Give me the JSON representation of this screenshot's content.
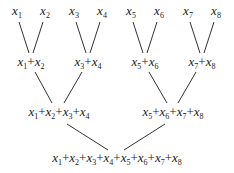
{
  "diagram": {
    "type": "binary reduction tree",
    "leaves": [
      {
        "var": "x",
        "sub": "1",
        "cx": 17,
        "y": 4
      },
      {
        "var": "x",
        "sub": "2",
        "cx": 45,
        "y": 4
      },
      {
        "var": "x",
        "sub": "3",
        "cx": 74,
        "y": 4
      },
      {
        "var": "x",
        "sub": "4",
        "cx": 102,
        "y": 4
      },
      {
        "var": "x",
        "sub": "5",
        "cx": 131,
        "y": 4
      },
      {
        "var": "x",
        "sub": "6",
        "cx": 159,
        "y": 4
      },
      {
        "var": "x",
        "sub": "7",
        "cx": 188,
        "y": 4
      },
      {
        "var": "x",
        "sub": "8",
        "cx": 216,
        "y": 4
      }
    ],
    "level2": [
      {
        "subs": [
          "1",
          "2"
        ],
        "cx": 31,
        "y": 55
      },
      {
        "subs": [
          "3",
          "4"
        ],
        "cx": 88,
        "y": 55
      },
      {
        "subs": [
          "5",
          "6"
        ],
        "cx": 145,
        "y": 55
      },
      {
        "subs": [
          "7",
          "8"
        ],
        "cx": 202,
        "y": 55
      }
    ],
    "level3": [
      {
        "subs": [
          "1",
          "2",
          "3",
          "4"
        ],
        "cx": 59,
        "y": 105
      },
      {
        "subs": [
          "5",
          "6",
          "7",
          "8"
        ],
        "cx": 173,
        "y": 105
      }
    ],
    "root": {
      "subs": [
        "1",
        "2",
        "3",
        "4",
        "5",
        "6",
        "7",
        "8"
      ],
      "cx": 117,
      "y": 151
    },
    "edges": [
      [
        19,
        22,
        29,
        53
      ],
      [
        43,
        22,
        33,
        53
      ],
      [
        76,
        22,
        86,
        53
      ],
      [
        100,
        22,
        90,
        53
      ],
      [
        133,
        22,
        143,
        53
      ],
      [
        157,
        22,
        147,
        53
      ],
      [
        190,
        22,
        200,
        53
      ],
      [
        214,
        22,
        204,
        53
      ],
      [
        35,
        72,
        52,
        103
      ],
      [
        82,
        72,
        64,
        103
      ],
      [
        149,
        72,
        167,
        103
      ],
      [
        196,
        72,
        178,
        103
      ],
      [
        67,
        124,
        108,
        150
      ],
      [
        165,
        124,
        124,
        150
      ]
    ],
    "line_color": "#333333"
  }
}
